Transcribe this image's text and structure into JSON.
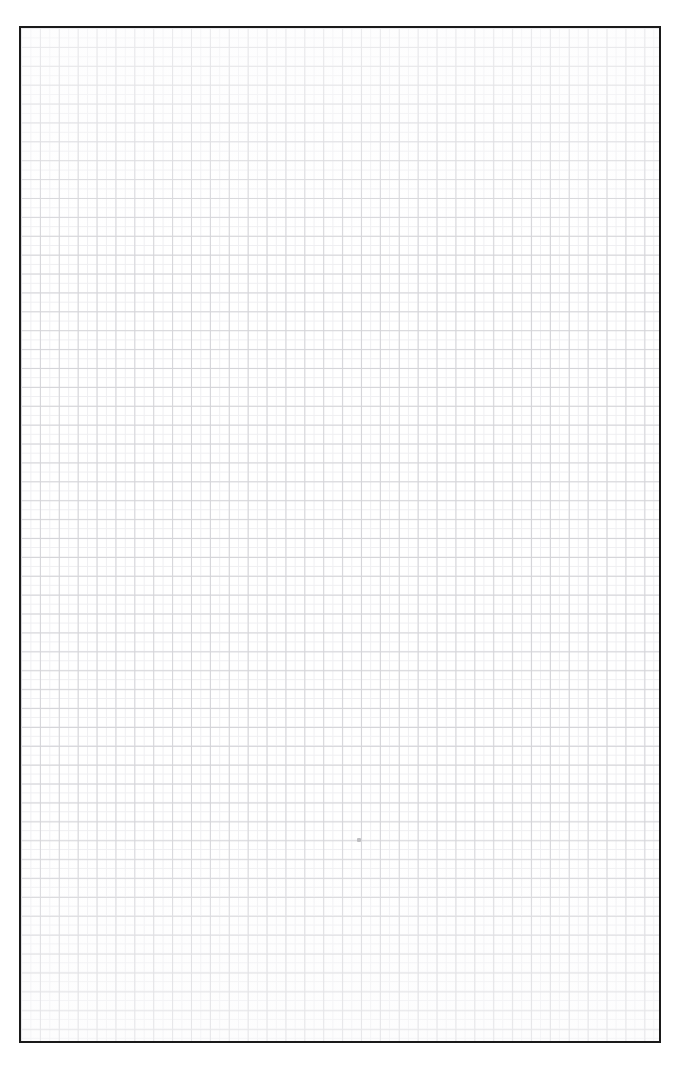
{
  "document": {
    "kind": "grid-paper-sheet",
    "title": "",
    "background_color": "#ffffff"
  },
  "sheet": {
    "border_color": "#1a1a1a",
    "border_width_px": 2,
    "fill_color": "#ffffff",
    "left_px": 19,
    "top_px": 26,
    "width_px": 642,
    "height_px": 1017
  },
  "grid": {
    "major_line_color": "#d4d4d8",
    "minor_line_color": "#eeeef1",
    "cell_size_px": 18.9,
    "minor_cell_size_px": 9.45,
    "columns": 34,
    "rows": 54,
    "major_line_width_px": 1,
    "minor_line_width_px": 1
  },
  "marks": [
    {
      "name": "stray-speck",
      "x_px": 355,
      "y_px": 836,
      "color": "#b9b9bd",
      "size_px": 4
    }
  ],
  "annotations": {
    "caption": ""
  }
}
